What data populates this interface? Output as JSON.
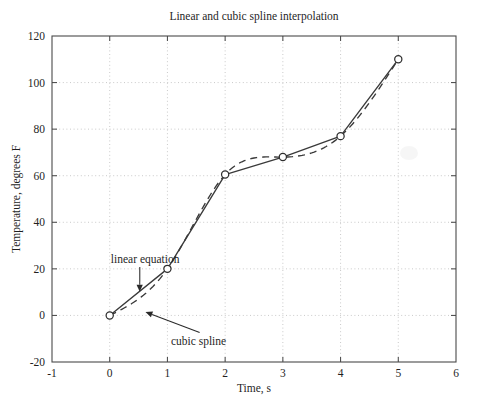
{
  "chart_data": {
    "type": "line",
    "title": "Linear and cubic spline interpolation",
    "xlabel": "Time, s",
    "ylabel": "Temperature, degrees F",
    "xlim": [
      -1,
      6
    ],
    "ylim": [
      -20,
      120
    ],
    "xticks": [
      "-1",
      "0",
      "1",
      "2",
      "3",
      "4",
      "5",
      "6"
    ],
    "xtick_values": [
      -1,
      0,
      1,
      2,
      3,
      4,
      5,
      6
    ],
    "yticks": [
      "-20",
      "0",
      "20",
      "40",
      "60",
      "80",
      "100",
      "120"
    ],
    "ytick_values": [
      -20,
      0,
      20,
      40,
      60,
      80,
      100,
      120
    ],
    "grid": true,
    "grid_style": "dotted",
    "legend": "none",
    "x": [
      0,
      1,
      2,
      3,
      4,
      5
    ],
    "series": [
      {
        "name": "linear equation",
        "style": "solid",
        "marker": "circle",
        "values": [
          0,
          20,
          60.5,
          68,
          77,
          110
        ]
      },
      {
        "name": "cubic spline",
        "style": "dashed",
        "marker": "none",
        "values": [
          0,
          20,
          60.5,
          68,
          77,
          110
        ],
        "note": "smooth cubic spline through the same six knots; dips below the chord between t=0 and t=1, bulges above between t=2 and t=4, sags below between t=4 and t=5"
      }
    ],
    "annotations": [
      {
        "label": "linear equation",
        "text_x": 0.02,
        "text_y": 22.5,
        "points_to_x": 0.52,
        "points_to_y": 10.2
      },
      {
        "label": "cubic spline",
        "text_x": 1.06,
        "text_y": -12.5,
        "points_to_x": 0.62,
        "points_to_y": 1.5
      }
    ]
  },
  "axis_colors": {
    "frame": "#4a4a4a",
    "grid": "#bdbdbd",
    "data": "#3a3a3a",
    "background": "#ffffff"
  }
}
